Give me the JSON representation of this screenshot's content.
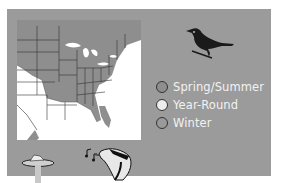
{
  "range_map": {
    "region": "Eastern North America",
    "colors": {
      "panel": "#9b9b9b",
      "map_background": "#ffffff",
      "range_fill": "#8e8e8e",
      "state_lines": "#333333"
    }
  },
  "legend": {
    "items": [
      {
        "label": "Spring/Summer",
        "color": "#8e8e8e"
      },
      {
        "label": "Year-Round",
        "color": "#ededed"
      },
      {
        "label": "Winter",
        "color": "#9a9a9a"
      }
    ]
  },
  "icons": {
    "bird": "bird-silhouette-icon",
    "feeder": "bird-feeder-icon",
    "song": "music-notes-icon",
    "bird_head": "bird-head-icon"
  }
}
